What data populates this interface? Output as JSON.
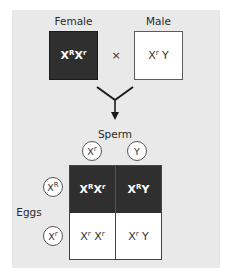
{
  "parents": {
    "female": {
      "label": "Female",
      "genotype": [
        {
          "base": "X",
          "sup": "R"
        },
        {
          "base": "X",
          "sup": "r"
        }
      ],
      "fill": "#2f2f2f"
    },
    "cross_symbol": "×",
    "male": {
      "label": "Male",
      "genotype": [
        {
          "base": "X",
          "sup": "r"
        },
        {
          "base": " Y",
          "sup": ""
        }
      ],
      "fill": "#ffffff"
    }
  },
  "arrow": {
    "icon": "merge-down-arrow-icon"
  },
  "punnett": {
    "sperm_label": "Sperm",
    "eggs_label": "Eggs",
    "sperm_gametes": [
      {
        "base": "X",
        "sup": "r"
      },
      {
        "base": "Y",
        "sup": ""
      }
    ],
    "egg_gametes": [
      {
        "base": "X",
        "sup": "R"
      },
      {
        "base": "X",
        "sup": "r"
      }
    ],
    "cells": [
      [
        {
          "parts": [
            {
              "base": "X",
              "sup": "R"
            },
            {
              "base": "X",
              "sup": "r"
            }
          ],
          "style": "dark"
        },
        {
          "parts": [
            {
              "base": "X",
              "sup": "R"
            },
            {
              "base": "Y",
              "sup": ""
            }
          ],
          "style": "dark"
        }
      ],
      [
        {
          "parts": [
            {
              "base": "X",
              "sup": "r"
            },
            {
              "base": " X",
              "sup": "r"
            }
          ],
          "style": "light"
        },
        {
          "parts": [
            {
              "base": "X",
              "sup": "r"
            },
            {
              "base": " Y",
              "sup": ""
            }
          ],
          "style": "light"
        }
      ]
    ]
  },
  "colors": {
    "panel_bg": "#e9e9e9",
    "dark_fill": "#2f2f2f",
    "light_fill": "#ffffff"
  }
}
